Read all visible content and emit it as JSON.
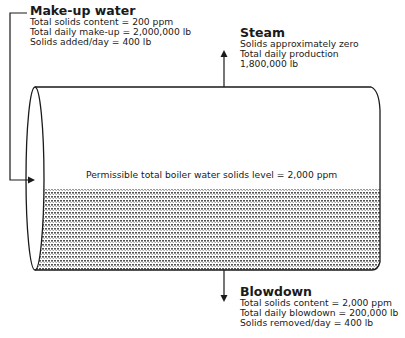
{
  "makeup": {
    "title": "Make-up water",
    "lines": [
      "Total solids content = 200 ppm",
      "Total daily make-up = 2,000,000 lb",
      "Solids added/day = 400 lb"
    ]
  },
  "steam": {
    "title": "Steam",
    "lines": [
      "Solids approximately zero",
      "Total daily production",
      "1,800,000 lb"
    ]
  },
  "boiler": {
    "level_label": "Permissible total boiler water solids level = 2,000 ppm"
  },
  "blowdown": {
    "title": "Blowdown",
    "lines": [
      "Total solids content = 2,000 ppm",
      "Total daily blowdown = 200,000 lb",
      "Solids removed/day = 400 lb"
    ]
  },
  "colors": {
    "stroke": "#1a1a1a",
    "hatch": "#555555"
  }
}
